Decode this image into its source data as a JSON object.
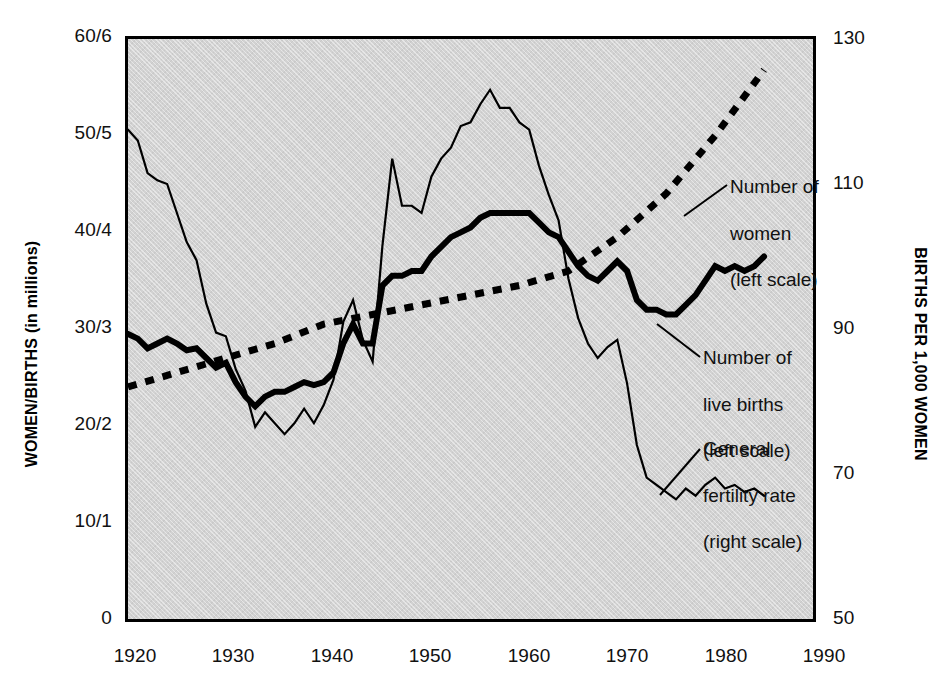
{
  "chart_data": {
    "type": "line",
    "title": "",
    "xlabel": "",
    "ylabel": "WOMEN/BIRTHS (in millions)",
    "y2label": "BIRTHS PER 1,000 WOMEN",
    "xlim": [
      1920,
      1990
    ],
    "ylim": [
      0,
      60
    ],
    "y2lim": [
      50,
      130
    ],
    "grid": false,
    "legend_position": "in-plot annotations with leader lines",
    "x_ticks": [
      "1920",
      "1930",
      "1940",
      "1950",
      "1960",
      "1970",
      "1980",
      "1990"
    ],
    "x_tick_values": [
      1920,
      1930,
      1940,
      1950,
      1960,
      1970,
      1980,
      1990
    ],
    "y_ticks": [
      "0",
      "10/1",
      "20/2",
      "30/3",
      "40/4",
      "50/5",
      "60/6"
    ],
    "y_tick_values": [
      0,
      10,
      20,
      30,
      40,
      50,
      60
    ],
    "y2_ticks": [
      "50",
      "70",
      "90",
      "110",
      "130"
    ],
    "y2_tick_values": [
      50,
      70,
      90,
      110,
      130
    ],
    "series": [
      {
        "name": "Number of women",
        "scale": "left",
        "units": "millions",
        "style": "dashed",
        "x": [
          1920,
          1925,
          1930,
          1935,
          1940,
          1945,
          1950,
          1955,
          1960,
          1965,
          1970,
          1975,
          1980,
          1985
        ],
        "values": [
          24.0,
          25.5,
          27.0,
          28.5,
          30.5,
          31.5,
          32.5,
          33.5,
          34.5,
          36.0,
          39.5,
          44.0,
          50.0,
          56.8
        ]
      },
      {
        "name": "Number of live births",
        "scale": "left",
        "units": "millions (shown as tens)",
        "style": "thick-solid",
        "x": [
          1920,
          1921,
          1922,
          1923,
          1924,
          1925,
          1926,
          1927,
          1928,
          1929,
          1930,
          1931,
          1932,
          1933,
          1934,
          1935,
          1936,
          1937,
          1938,
          1939,
          1940,
          1941,
          1942,
          1943,
          1944,
          1945,
          1946,
          1947,
          1948,
          1949,
          1950,
          1951,
          1952,
          1953,
          1954,
          1955,
          1956,
          1957,
          1958,
          1959,
          1960,
          1961,
          1962,
          1963,
          1964,
          1965,
          1966,
          1967,
          1968,
          1969,
          1970,
          1971,
          1972,
          1973,
          1974,
          1975,
          1976,
          1977,
          1978,
          1979,
          1980,
          1981,
          1982,
          1983,
          1984,
          1985
        ],
        "values": [
          29.5,
          29.0,
          28.0,
          28.5,
          29.0,
          28.5,
          27.8,
          28.0,
          27.0,
          26.0,
          26.5,
          24.5,
          23.0,
          22.0,
          23.0,
          23.5,
          23.5,
          24.0,
          24.5,
          24.2,
          24.5,
          25.5,
          28.5,
          30.5,
          28.5,
          28.5,
          34.5,
          35.5,
          35.5,
          36.0,
          36.0,
          37.5,
          38.5,
          39.5,
          40.0,
          40.5,
          41.5,
          42.0,
          42.0,
          42.0,
          42.0,
          42.0,
          41.0,
          40.0,
          39.5,
          38.0,
          36.5,
          35.5,
          35.0,
          36.0,
          37.0,
          36.0,
          33.0,
          32.0,
          32.0,
          31.5,
          31.5,
          32.5,
          33.5,
          35.0,
          36.5,
          36.0,
          36.5,
          36.0,
          36.5,
          37.5
        ]
      },
      {
        "name": "General fertility rate",
        "scale": "right",
        "units": "births per 1,000 women",
        "style": "thin-solid",
        "x": [
          1920,
          1921,
          1922,
          1923,
          1924,
          1925,
          1926,
          1927,
          1928,
          1929,
          1930,
          1931,
          1932,
          1933,
          1934,
          1935,
          1936,
          1937,
          1938,
          1939,
          1940,
          1941,
          1942,
          1943,
          1944,
          1945,
          1946,
          1947,
          1948,
          1949,
          1950,
          1951,
          1952,
          1953,
          1954,
          1955,
          1956,
          1957,
          1958,
          1959,
          1960,
          1961,
          1962,
          1963,
          1964,
          1965,
          1966,
          1967,
          1968,
          1969,
          1970,
          1971,
          1972,
          1973,
          1974,
          1975,
          1976,
          1977,
          1978,
          1979,
          1980,
          1981,
          1982,
          1983,
          1984,
          1985
        ],
        "values": [
          117.5,
          116.0,
          111.5,
          110.5,
          110.0,
          106.0,
          102.0,
          99.5,
          93.5,
          89.5,
          89.0,
          84.5,
          81.5,
          76.5,
          78.5,
          77.0,
          75.5,
          77.0,
          79.0,
          77.0,
          79.5,
          83.0,
          91.0,
          94.0,
          88.5,
          85.5,
          101.5,
          113.5,
          107.0,
          107.0,
          106.0,
          111.0,
          113.5,
          115.0,
          118.0,
          118.5,
          121.0,
          123.0,
          120.5,
          120.5,
          118.5,
          117.5,
          112.5,
          108.5,
          105.0,
          97.0,
          91.5,
          88.0,
          86.0,
          87.5,
          88.5,
          82.5,
          74.0,
          69.5,
          68.5,
          67.5,
          66.5,
          68.0,
          67.0,
          68.5,
          69.5,
          68.0,
          68.5,
          67.5,
          68.0,
          67.0
        ]
      }
    ],
    "annotations": [
      {
        "id": "women",
        "text": "Number of\nwomen\n(left scale)"
      },
      {
        "id": "births",
        "text": "Number of\nlive births\n(left scale)"
      },
      {
        "id": "fertility",
        "text": "General\nfertility rate\n(right scale)"
      }
    ]
  },
  "axes": {
    "left_title": "WOMEN/BIRTHS (in millions)",
    "right_title": "BIRTHS PER 1,000 WOMEN"
  },
  "ticks": {
    "left": [
      "60/6",
      "50/5",
      "40/4",
      "30/3",
      "20/2",
      "10/1",
      "0"
    ],
    "right": [
      "130",
      "110",
      "90",
      "70",
      "50"
    ],
    "bottom": [
      "1920",
      "1930",
      "1940",
      "1950",
      "1960",
      "1970",
      "1980",
      "1990"
    ]
  },
  "annotations": {
    "women": {
      "l1": "Number of",
      "l2": "women",
      "l3": "(left scale)"
    },
    "births": {
      "l1": "Number of",
      "l2": "live births",
      "l3": "(left scale)"
    },
    "fertility": {
      "l1": "General",
      "l2": "fertility rate",
      "l3": "(right scale)"
    }
  },
  "colors": {
    "plot_background": "#d2d2d2",
    "frame": "#000000",
    "line": "#000000",
    "page_background": "#ffffff"
  }
}
